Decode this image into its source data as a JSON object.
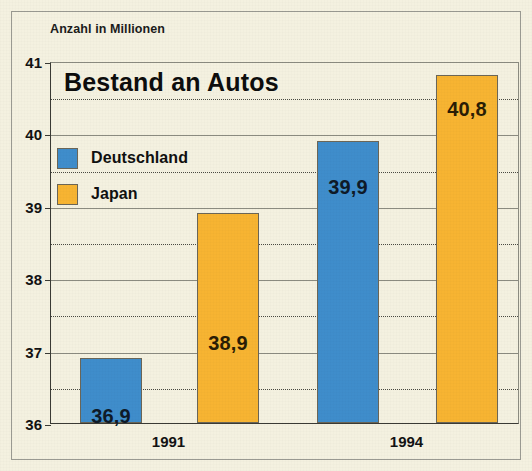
{
  "figure": {
    "unit_caption": "Anzahl in Millionen",
    "title": "Bestand an Autos"
  },
  "legend": {
    "items": [
      {
        "label": "Deutschland",
        "color": "#3f8dcb",
        "swatch": "blue"
      },
      {
        "label": "Japan",
        "color": "#f7b432",
        "swatch": "orange"
      }
    ]
  },
  "axis": {
    "y_ticks": [
      "41",
      "40",
      "39",
      "38",
      "37",
      "36"
    ],
    "x_ticks": [
      "1991",
      "1994"
    ]
  },
  "bars": [
    {
      "name": "bar-1991-deutschland",
      "label": "36,9",
      "color": "blue"
    },
    {
      "name": "bar-1991-japan",
      "label": "38,9",
      "color": "orange"
    },
    {
      "name": "bar-1994-deutschland",
      "label": "39,9",
      "color": "blue"
    },
    {
      "name": "bar-1994-japan",
      "label": "40,8",
      "color": "orange"
    }
  ],
  "chart_data": {
    "type": "bar",
    "title": "Bestand an Autos",
    "subtitle": "",
    "xlabel": "",
    "ylabel": "Anzahl in Millionen",
    "categories": [
      "1991",
      "1994"
    ],
    "series": [
      {
        "name": "Deutschland",
        "color": "#3f8dcb",
        "values": [
          36.9,
          39.9
        ],
        "labels": [
          "36,9",
          "39,9"
        ]
      },
      {
        "name": "Japan",
        "color": "#f7b432",
        "values": [
          38.9,
          40.8
        ],
        "labels": [
          "38,9",
          "40,8"
        ]
      }
    ],
    "ylim": [
      36,
      41
    ],
    "ytick_values": [
      36,
      37,
      38,
      39,
      40,
      41
    ],
    "ytick_labels": [
      "36",
      "37",
      "38",
      "39",
      "40",
      "41"
    ],
    "minor_gridlines_at": [
      36.5,
      37.5,
      38.5,
      39.5,
      40.5
    ],
    "grid": "horizontal solid at integers, dotted at halves",
    "legend_position": "inside upper-left",
    "decimal_separator": ","
  }
}
